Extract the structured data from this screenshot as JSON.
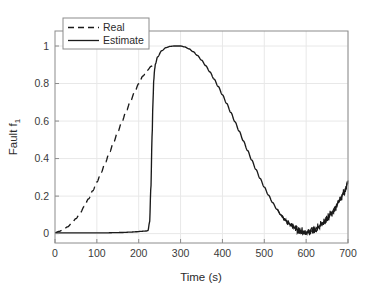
{
  "chart_data": {
    "type": "line",
    "title": "",
    "xlabel": "Time (s)",
    "ylabel": "Fault f",
    "ylabel_subscript": "1",
    "xlim": [
      0,
      700
    ],
    "ylim": [
      -0.05,
      1.08
    ],
    "xticks": [
      0,
      100,
      200,
      300,
      400,
      500,
      600,
      700
    ],
    "xticklabels": [
      "0",
      "100",
      "200",
      "300",
      "400",
      "500",
      "600",
      "700"
    ],
    "yticks": [
      0,
      0.2,
      0.4,
      0.6,
      0.8,
      1
    ],
    "yticklabels": [
      "0",
      "0.2",
      "0.4",
      "0.6",
      "0.8",
      "1"
    ],
    "grid": true,
    "grid_color": "#e8e8e8",
    "axis_color": "#8c8c8c",
    "background": "#ffffff",
    "legend": {
      "position": "upper-left-inside",
      "entries": [
        {
          "name": "Real",
          "style": "dashed",
          "color": "#1a1a1a"
        },
        {
          "name": "Estimate",
          "style": "solid",
          "color": "#1a1a1a"
        }
      ]
    },
    "series": [
      {
        "name": "Real",
        "style": "dashed",
        "color": "#1a1a1a",
        "x": [
          0,
          10,
          20,
          30,
          40,
          50,
          60,
          70,
          80,
          90,
          100,
          110,
          120,
          130,
          140,
          150,
          160,
          170,
          180,
          190,
          200,
          210,
          220,
          230,
          235
        ],
        "y": [
          0.005,
          0.012,
          0.022,
          0.036,
          0.055,
          0.08,
          0.11,
          0.145,
          0.185,
          0.228,
          0.275,
          0.325,
          0.378,
          0.432,
          0.487,
          0.543,
          0.598,
          0.652,
          0.704,
          0.753,
          0.799,
          0.84,
          0.87,
          0.892,
          0.9
        ]
      },
      {
        "name": "Estimate",
        "style": "solid",
        "color": "#1a1a1a",
        "x": [
          0,
          20,
          40,
          60,
          80,
          100,
          120,
          140,
          160,
          180,
          195,
          205,
          212,
          218,
          222,
          226,
          229,
          232,
          234,
          236,
          238,
          240,
          245,
          255,
          265,
          275,
          285,
          295,
          300,
          310,
          320,
          330,
          340,
          350,
          360,
          370,
          380,
          390,
          400,
          410,
          420,
          430,
          440,
          450,
          460,
          470,
          480,
          490,
          500,
          510,
          520,
          530,
          540,
          550,
          560,
          570,
          580,
          590,
          600,
          610,
          620,
          630,
          640,
          650,
          660,
          670,
          680,
          690,
          700
        ],
        "y": [
          0.004,
          0.004,
          0.004,
          0.004,
          0.004,
          0.004,
          0.004,
          0.005,
          0.006,
          0.008,
          0.01,
          0.012,
          0.013,
          0.014,
          0.016,
          0.06,
          0.24,
          0.52,
          0.7,
          0.82,
          0.875,
          0.905,
          0.942,
          0.975,
          0.991,
          0.998,
          1.0,
          1.0,
          1.0,
          0.995,
          0.985,
          0.97,
          0.95,
          0.925,
          0.895,
          0.862,
          0.824,
          0.784,
          0.74,
          0.694,
          0.646,
          0.596,
          0.546,
          0.494,
          0.443,
          0.392,
          0.342,
          0.294,
          0.248,
          0.205,
          0.165,
          0.13,
          0.099,
          0.073,
          0.051,
          0.034,
          0.021,
          0.012,
          0.008,
          0.012,
          0.022,
          0.038,
          0.058,
          0.082,
          0.11,
          0.142,
          0.178,
          0.22,
          0.268
        ],
        "noise": {
          "starts_at_x": 530,
          "max_amplitude": 0.022
        }
      }
    ]
  }
}
